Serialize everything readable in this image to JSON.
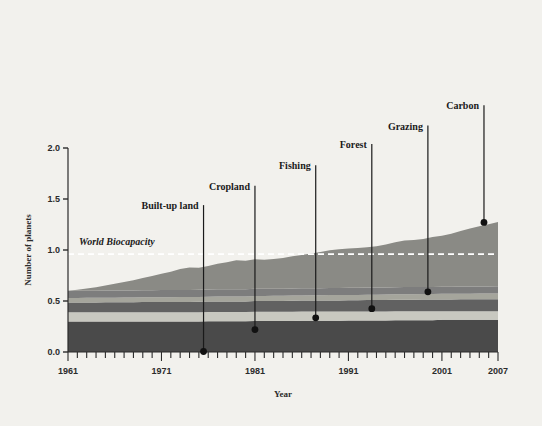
{
  "figure": {
    "background_color": "#f2f1ed",
    "axis_color": "#2b2b2b"
  },
  "chart_data": {
    "type": "area",
    "title": "",
    "xlabel": "Year",
    "ylabel": "Number of planets",
    "xlim": [
      1961,
      2007
    ],
    "ylim": [
      0.0,
      2.0
    ],
    "grid": false,
    "legend_position": "none",
    "stacked": true,
    "x": [
      1961,
      1962,
      1963,
      1964,
      1965,
      1966,
      1967,
      1968,
      1969,
      1970,
      1971,
      1972,
      1973,
      1974,
      1975,
      1976,
      1977,
      1978,
      1979,
      1980,
      1981,
      1982,
      1983,
      1984,
      1985,
      1986,
      1987,
      1988,
      1989,
      1990,
      1991,
      1992,
      1993,
      1994,
      1995,
      1996,
      1997,
      1998,
      1999,
      2000,
      2001,
      2002,
      2003,
      2004,
      2005,
      2006,
      2007
    ],
    "xticks": [
      1961,
      1971,
      1981,
      1991,
      2001,
      2007
    ],
    "xticklabels": [
      "1961",
      "1971",
      "1981",
      "1991",
      "2001",
      "2007"
    ],
    "yticks": [
      0.0,
      0.5,
      1.0,
      1.5,
      2.0
    ],
    "yticklabels": [
      "0.0",
      "0.5",
      "1.0",
      "1.5",
      "2.0"
    ],
    "minor_xticks_every": 1,
    "series": [
      {
        "name": "Built-up land",
        "color": "#4a4a4a",
        "values": [
          0.3,
          0.3,
          0.3,
          0.3,
          0.3,
          0.3,
          0.3,
          0.3,
          0.3,
          0.3,
          0.3,
          0.3,
          0.3,
          0.3,
          0.3,
          0.302,
          0.302,
          0.302,
          0.302,
          0.302,
          0.305,
          0.305,
          0.305,
          0.305,
          0.305,
          0.307,
          0.307,
          0.307,
          0.307,
          0.307,
          0.31,
          0.31,
          0.31,
          0.31,
          0.31,
          0.312,
          0.312,
          0.312,
          0.312,
          0.312,
          0.315,
          0.315,
          0.315,
          0.315,
          0.315,
          0.315,
          0.315
        ]
      },
      {
        "name": "Cropland",
        "color": "#c8c8c0",
        "values": [
          0.09,
          0.09,
          0.09,
          0.09,
          0.09,
          0.09,
          0.09,
          0.09,
          0.09,
          0.09,
          0.09,
          0.09,
          0.09,
          0.09,
          0.09,
          0.09,
          0.09,
          0.09,
          0.09,
          0.09,
          0.09,
          0.09,
          0.09,
          0.09,
          0.09,
          0.09,
          0.09,
          0.09,
          0.09,
          0.09,
          0.088,
          0.088,
          0.088,
          0.088,
          0.088,
          0.088,
          0.088,
          0.088,
          0.088,
          0.088,
          0.085,
          0.085,
          0.085,
          0.085,
          0.085,
          0.085,
          0.085
        ]
      },
      {
        "name": "Fishing",
        "color": "#616161",
        "values": [
          0.095,
          0.095,
          0.096,
          0.096,
          0.097,
          0.097,
          0.098,
          0.098,
          0.099,
          0.099,
          0.1,
          0.1,
          0.101,
          0.101,
          0.102,
          0.102,
          0.103,
          0.103,
          0.104,
          0.104,
          0.105,
          0.105,
          0.106,
          0.106,
          0.107,
          0.107,
          0.108,
          0.108,
          0.109,
          0.109,
          0.11,
          0.11,
          0.111,
          0.111,
          0.112,
          0.112,
          0.113,
          0.113,
          0.114,
          0.114,
          0.115,
          0.115,
          0.116,
          0.116,
          0.117,
          0.117,
          0.118
        ]
      },
      {
        "name": "Forest",
        "color": "#a5a59c",
        "values": [
          0.045,
          0.045,
          0.045,
          0.045,
          0.046,
          0.046,
          0.046,
          0.046,
          0.047,
          0.047,
          0.047,
          0.047,
          0.048,
          0.048,
          0.048,
          0.048,
          0.049,
          0.049,
          0.049,
          0.049,
          0.05,
          0.05,
          0.05,
          0.05,
          0.051,
          0.051,
          0.051,
          0.051,
          0.052,
          0.052,
          0.052,
          0.052,
          0.053,
          0.053,
          0.053,
          0.053,
          0.054,
          0.054,
          0.054,
          0.054,
          0.055,
          0.055,
          0.055,
          0.055,
          0.056,
          0.056,
          0.056
        ]
      },
      {
        "name": "Grazing",
        "color": "#7d7d7d",
        "values": [
          0.07,
          0.07,
          0.07,
          0.07,
          0.07,
          0.07,
          0.07,
          0.07,
          0.07,
          0.07,
          0.07,
          0.07,
          0.07,
          0.07,
          0.07,
          0.07,
          0.07,
          0.07,
          0.07,
          0.07,
          0.07,
          0.07,
          0.07,
          0.07,
          0.07,
          0.07,
          0.07,
          0.07,
          0.07,
          0.07,
          0.07,
          0.07,
          0.07,
          0.07,
          0.07,
          0.07,
          0.07,
          0.07,
          0.07,
          0.07,
          0.07,
          0.07,
          0.07,
          0.07,
          0.07,
          0.07,
          0.07
        ]
      },
      {
        "name": "Carbon",
        "color": "#8a8a85",
        "values": [
          0.0,
          0.01,
          0.022,
          0.035,
          0.05,
          0.065,
          0.082,
          0.1,
          0.12,
          0.14,
          0.16,
          0.18,
          0.205,
          0.22,
          0.215,
          0.23,
          0.25,
          0.265,
          0.285,
          0.28,
          0.29,
          0.285,
          0.29,
          0.3,
          0.315,
          0.325,
          0.34,
          0.355,
          0.37,
          0.38,
          0.385,
          0.39,
          0.395,
          0.405,
          0.42,
          0.44,
          0.455,
          0.46,
          0.47,
          0.49,
          0.5,
          0.52,
          0.545,
          0.57,
          0.59,
          0.61,
          0.63
        ]
      }
    ],
    "totals": [
      0.6,
      0.61,
      0.623,
      0.636,
      0.653,
      0.668,
      0.686,
      0.704,
      0.726,
      0.746,
      0.767,
      0.787,
      0.814,
      0.829,
      0.822,
      0.844,
      0.866,
      0.881,
      0.902,
      0.895,
      0.91,
      0.905,
      0.911,
      0.921,
      0.938,
      0.95,
      0.966,
      0.981,
      0.998,
      1.008,
      1.015,
      1.02,
      1.027,
      1.037,
      1.053,
      1.077,
      1.092,
      1.097,
      1.108,
      1.128,
      1.14,
      1.16,
      1.186,
      1.211,
      1.233,
      1.253,
      1.274
    ],
    "reference_line": {
      "label": "World Biocapacity",
      "value": 0.96,
      "color": "#ffffff",
      "style": "dashed"
    },
    "annotations": [
      {
        "label": "Built-up land",
        "x_year": 1975.5,
        "y_value": 0.005,
        "label_x_year": 1975.0,
        "label_y_value": 1.44,
        "anchor": "end"
      },
      {
        "label": "Cropland",
        "x_year": 1981.0,
        "y_value": 0.22,
        "label_x_year": 1980.5,
        "label_y_value": 1.63,
        "anchor": "end"
      },
      {
        "label": "Fishing",
        "x_year": 1987.5,
        "y_value": 0.335,
        "label_x_year": 1987.0,
        "label_y_value": 1.83,
        "anchor": "end"
      },
      {
        "label": "Forest",
        "x_year": 1993.5,
        "y_value": 0.425,
        "label_x_year": 1993.0,
        "label_y_value": 2.04,
        "anchor": "end"
      },
      {
        "label": "Grazing",
        "x_year": 1999.5,
        "y_value": 0.59,
        "label_x_year": 1999.0,
        "label_y_value": 2.22,
        "anchor": "end"
      },
      {
        "label": "Carbon",
        "x_year": 2005.5,
        "y_value": 1.27,
        "label_x_year": 2005.0,
        "label_y_value": 2.42,
        "anchor": "end"
      }
    ]
  }
}
